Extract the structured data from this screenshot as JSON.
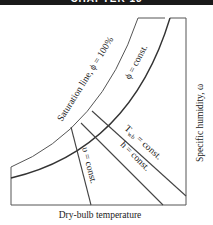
{
  "header": {
    "title": "CHAPTER 13"
  },
  "diagram": {
    "x_axis_label": "Dry-bulb temperature",
    "y_axis_label": "Specific humidity, ω",
    "lines": {
      "saturation": "Saturation line, ϕ = 100%",
      "phi_const": "ϕ = const.",
      "twb_const_T": "T",
      "twb_const_sub": "wb",
      "twb_const_rest": " = const.",
      "h_const": "h = const.",
      "v_const": "υ = const."
    },
    "colors": {
      "line": "#333333",
      "header": "#1a1a1a",
      "text": "#222222"
    }
  }
}
